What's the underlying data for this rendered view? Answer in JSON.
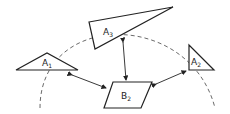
{
  "diagram": {
    "shapes": [
      {
        "id": "A1",
        "label": "A",
        "sub": "1"
      },
      {
        "id": "A2",
        "label": "A",
        "sub": "2"
      },
      {
        "id": "A3",
        "label": "A",
        "sub": "3"
      },
      {
        "id": "B2",
        "label": "B",
        "sub": "2"
      }
    ],
    "connections": [
      {
        "from": "B2",
        "to": "A1",
        "bidirectional": true
      },
      {
        "from": "B2",
        "to": "A2",
        "bidirectional": true
      },
      {
        "from": "B2",
        "to": "A3",
        "bidirectional": true
      }
    ],
    "arc": {
      "style": "dashed",
      "description": "semicircular arc through A1, A3, A2"
    },
    "colors": {
      "stroke": "#222222",
      "background": "#ffffff"
    }
  }
}
